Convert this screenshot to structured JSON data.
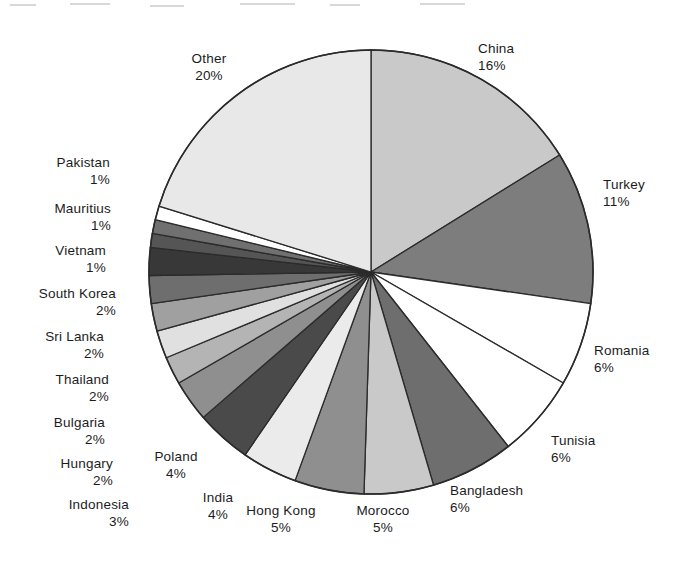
{
  "chart_data": {
    "type": "pie",
    "title": "",
    "subtitle": "",
    "xlabel": "",
    "ylabel": "",
    "legend_position": "callout-labels",
    "grid": false,
    "unit": "%",
    "start_angle_deg": 0,
    "direction": "clockwise",
    "categories": [
      "China",
      "Turkey",
      "Romania",
      "Tunisia",
      "Bangladesh",
      "Morocco",
      "Hong Kong",
      "India",
      "Poland",
      "Indonesia",
      "Hungary",
      "Bulgaria",
      "Thailand",
      "Sri Lanka",
      "South Korea",
      "Vietnam",
      "Mauritius",
      "Pakistan",
      "Other"
    ],
    "values": [
      16,
      11,
      6,
      6,
      6,
      5,
      5,
      4,
      4,
      3,
      2,
      2,
      2,
      2,
      2,
      1,
      1,
      1,
      20
    ],
    "slice_colors": [
      "#c9c9c9",
      "#7d7d7d",
      "#ffffff",
      "#ffffff",
      "#6e6e6e",
      "#c9c9c9",
      "#8f8f8f",
      "#ebebeb",
      "#4a4a4a",
      "#8f8f8f",
      "#b4b4b4",
      "#e0e0e0",
      "#a0a0a0",
      "#6e6e6e",
      "#383838",
      "#555555",
      "#707070",
      "#ffffff",
      "#e8e8e8"
    ],
    "stroke_color": "#2b2b2b"
  },
  "labels": [
    {
      "name": "China",
      "value": "16%",
      "align": "left",
      "x": 478,
      "y": 40
    },
    {
      "name": "Turkey",
      "value": "11%",
      "align": "left",
      "x": 603,
      "y": 176
    },
    {
      "name": "Romania",
      "value": "6%",
      "align": "left",
      "x": 594,
      "y": 342
    },
    {
      "name": "Tunisia",
      "value": "6%",
      "align": "left",
      "x": 551,
      "y": 432
    },
    {
      "name": "Bangladesh",
      "value": "6%",
      "align": "left",
      "x": 450,
      "y": 482
    },
    {
      "name": "Morocco",
      "value": "5%",
      "align": "center",
      "x": 383,
      "y": 502
    },
    {
      "name": "Hong Kong",
      "value": "5%",
      "align": "center",
      "x": 281,
      "y": 502
    },
    {
      "name": "India",
      "value": "4%",
      "align": "center",
      "x": 218,
      "y": 489
    },
    {
      "name": "Poland",
      "value": "4%",
      "align": "center",
      "x": 176,
      "y": 448
    },
    {
      "name": "Indonesia",
      "value": "3%",
      "align": "right",
      "x": 129,
      "y": 496
    },
    {
      "name": "Hungary",
      "value": "2%",
      "align": "right",
      "x": 113,
      "y": 455
    },
    {
      "name": "Bulgaria",
      "value": "2%",
      "align": "right",
      "x": 105,
      "y": 414
    },
    {
      "name": "Thailand",
      "value": "2%",
      "align": "right",
      "x": 109,
      "y": 371
    },
    {
      "name": "Sri Lanka",
      "value": "2%",
      "align": "right",
      "x": 104,
      "y": 328
    },
    {
      "name": "South Korea",
      "value": "2%",
      "align": "right",
      "x": 116,
      "y": 285
    },
    {
      "name": "Vietnam",
      "value": "1%",
      "align": "right",
      "x": 106,
      "y": 242
    },
    {
      "name": "Mauritius",
      "value": "1%",
      "align": "right",
      "x": 111,
      "y": 200
    },
    {
      "name": "Pakistan",
      "value": "1%",
      "align": "right",
      "x": 110,
      "y": 154
    },
    {
      "name": "Other",
      "value": "20%",
      "align": "center",
      "x": 209,
      "y": 50
    }
  ]
}
